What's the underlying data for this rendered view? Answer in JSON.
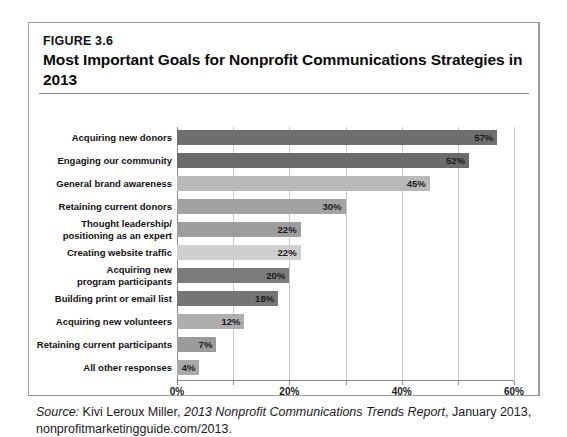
{
  "figure": {
    "number": "FIGURE 3.6",
    "title": "Most Important Goals for Nonprofit Communications Strategies in 2013"
  },
  "source": {
    "label": "Source:",
    "author": " Kivi Leroux Miller, ",
    "report": "2013 Nonprofit Communications Trends Report",
    "tail": ", January 2013, nonprofitmarketingguide.com/2013."
  },
  "chart_data": {
    "type": "bar",
    "orientation": "horizontal",
    "title": "Most Important Goals for Nonprofit Communications Strategies in 2013",
    "xlabel": "",
    "ylabel": "",
    "xlim": [
      0,
      60
    ],
    "xticks": [
      "0%",
      "20%",
      "40%",
      "60%"
    ],
    "xtick_values": [
      0,
      20,
      40,
      60
    ],
    "minor_gridlines": [
      10,
      30,
      50
    ],
    "grid": true,
    "legend": "none",
    "value_suffix": "%",
    "categories": [
      "Acquiring new donors",
      "Engaging our community",
      "General brand awareness",
      "Retaining current donors",
      "Thought leadership/\npositioning as an expert",
      "Creating website traffic",
      "Acquiring new\nprogram participants",
      "Building print or email list",
      "Acquiring new volunteers",
      "Retaining current participants",
      "All other responses"
    ],
    "values": [
      57,
      52,
      45,
      30,
      22,
      22,
      20,
      18,
      12,
      7,
      4
    ],
    "labels": [
      "57%",
      "52%",
      "45%",
      "30%",
      "22%",
      "22%",
      "20%",
      "18%",
      "12%",
      "7%",
      "4%"
    ],
    "bar_colors": [
      "#6e6e6e",
      "#6b6b6b",
      "#b9b9b9",
      "#a2a2a2",
      "#9d9d9d",
      "#cfcfcf",
      "#7b7b7b",
      "#757575",
      "#aeaeae",
      "#9b9b9b",
      "#a8a8a8"
    ]
  }
}
